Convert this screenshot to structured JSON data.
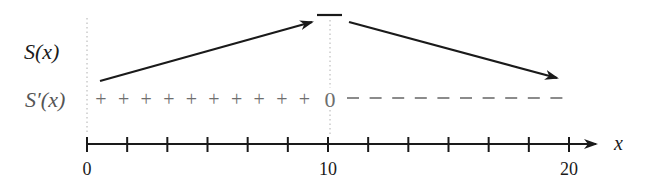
{
  "diagram": {
    "row_labels": {
      "function": "S(x)",
      "derivative": "S′(x)"
    },
    "axis": {
      "variable_label": "x",
      "min": 0,
      "max": 20,
      "tick_labels": [
        {
          "value": 0,
          "label": "0"
        },
        {
          "value": 10,
          "label": "10"
        },
        {
          "value": 20,
          "label": "20"
        }
      ],
      "ticks_per_interval": 6,
      "tick_count": 13
    },
    "critical_point": {
      "x": 10,
      "derivative_value": "0",
      "behavior": "maximum"
    },
    "sign_chart": {
      "left_sign": "+",
      "left_sign_count": 10,
      "zero_label": "0",
      "right_sign": "−",
      "right_sign_count": 10
    },
    "behavior": [
      {
        "interval": "0 < x < 10",
        "direction": "increasing"
      },
      {
        "interval": "10 < x < 20",
        "direction": "decreasing"
      }
    ],
    "colors": {
      "ink": "#1a1a1a",
      "sign_gray": "#6e6e6e",
      "dotted_gray": "#b0b0b0"
    }
  }
}
